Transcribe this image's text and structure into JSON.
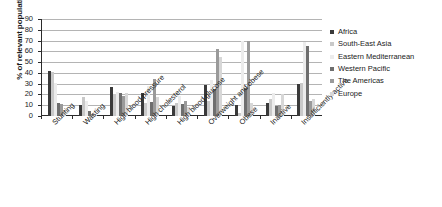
{
  "chart_data": {
    "type": "bar",
    "title": "",
    "xlabel": "",
    "ylabel": "% of relevant population",
    "ylim": [
      0,
      90
    ],
    "ytick_step": 10,
    "yticks": [
      0,
      10,
      20,
      30,
      40,
      50,
      60,
      70,
      80,
      90
    ],
    "grid": true,
    "legend_position": "right",
    "categories": [
      "Stunting",
      "Wasting",
      "High blood pressure",
      "High cholesterol",
      "High blood glucose",
      "Overweight and obese",
      "Obese",
      "Inactive",
      "Insufficiently active"
    ],
    "series": [
      {
        "name": "Africa",
        "color": "#3a3a3a",
        "values": [
          42,
          10,
          27,
          21,
          9,
          29,
          10,
          12,
          30
        ]
      },
      {
        "name": "South-East Asia",
        "color": "#c9c9c9",
        "values": [
          41,
          18,
          20,
          12,
          12,
          14,
          3,
          16,
          31
        ]
      },
      {
        "name": "Eastern Mediterranean",
        "color": "#ececec",
        "values": [
          31,
          14,
          22,
          28,
          19,
          33,
          70,
          21,
          69
        ]
      },
      {
        "name": "Western Pacific",
        "color": "#6e6e6e",
        "values": [
          12,
          5,
          21,
          13,
          11,
          25,
          26,
          9,
          65
        ]
      },
      {
        "name": "The Americas",
        "color": "#9a9a9a",
        "values": [
          11,
          2,
          19,
          34,
          14,
          62,
          70,
          10,
          14
        ]
      },
      {
        "name": "Europe",
        "color": "#d7d7d7",
        "values": [
          6,
          1,
          21,
          18,
          8,
          55,
          12,
          20,
          16
        ]
      }
    ]
  },
  "legend": {
    "items": [
      "Africa",
      "South-East Asia",
      "Eastern Mediterranean",
      "Western Pacific",
      "The Americas",
      "Europe"
    ]
  }
}
